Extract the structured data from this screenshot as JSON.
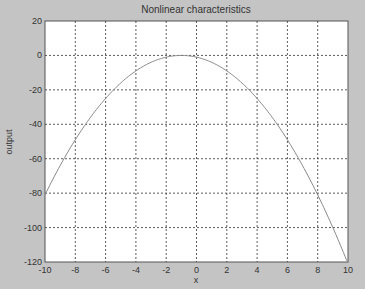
{
  "chart_data": {
    "type": "line",
    "title": "Nonlinear characteristics",
    "xlabel": "x",
    "ylabel": "output",
    "xlim": [
      -10,
      10
    ],
    "ylim": [
      -120,
      20
    ],
    "xticks": [
      -10,
      -8,
      -6,
      -4,
      -2,
      0,
      2,
      4,
      6,
      8,
      10
    ],
    "yticks": [
      20,
      0,
      -20,
      -40,
      -60,
      -80,
      -100,
      -120
    ],
    "grid": true,
    "legend": null,
    "series": [
      {
        "name": "output",
        "color": "#8a8a8a",
        "x": [
          -10,
          -9,
          -8,
          -7,
          -6,
          -5,
          -4,
          -3,
          -2,
          -1,
          0,
          1,
          2,
          3,
          4,
          5,
          6,
          7,
          8,
          9,
          10
        ],
        "y": [
          -81,
          -64,
          -49,
          -36,
          -25,
          -16,
          -9,
          -4,
          -1,
          0,
          -1,
          -4,
          -9,
          -16,
          -25,
          -36,
          -49,
          -64,
          -81,
          -100,
          -121
        ]
      }
    ]
  },
  "colors": {
    "figure_bg": "#c4c4c4",
    "axes_bg": "#ffffff",
    "grid": "#333333",
    "line": "#8a8a8a"
  }
}
